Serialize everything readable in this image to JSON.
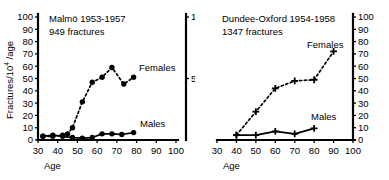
{
  "figure": {
    "background": "#ffffff",
    "ink_color": "#000000"
  },
  "chart_data": [
    {
      "type": "line",
      "panel": "left",
      "title": "Malmö 1953-1957",
      "subtitle": "949 fractures",
      "xlabel": "Age",
      "ylabel": "Fractures/10",
      "ylabel_exponent": "4",
      "ylabel_suffix": " /age",
      "xlim": [
        30,
        100
      ],
      "ylim": [
        0,
        100
      ],
      "xticks": [
        30,
        40,
        50,
        60,
        70,
        80,
        90,
        100
      ],
      "yticks": [
        0,
        10,
        20,
        30,
        40,
        50,
        60,
        70,
        80,
        90,
        100
      ],
      "xtick_labels": [
        "30",
        "40",
        "50",
        "60",
        "70",
        "80",
        "90",
        "100"
      ],
      "ytick_labels": [
        "0",
        "10",
        "20",
        "30",
        "40",
        "50",
        "60",
        "70",
        "80",
        "90",
        "100"
      ],
      "grid": false,
      "legend_position": "inline-right",
      "marker": "filled-circle",
      "series": [
        {
          "name": "Females",
          "label": "Females",
          "linestyle": "dashed",
          "x": [
            32.5,
            37.5,
            42.5,
            45,
            47.5,
            52.5,
            57.5,
            62.5,
            67.5,
            73.5,
            78.5
          ],
          "values": [
            3,
            3,
            4,
            5,
            10,
            31,
            47,
            51,
            59,
            45.5,
            51
          ]
        },
        {
          "name": "Males",
          "label": "Males",
          "linestyle": "solid",
          "x": [
            32.5,
            37.5,
            42.5,
            47.5,
            52.5,
            57.5,
            62.5,
            67.5,
            72.5,
            78.5
          ],
          "values": [
            3,
            4,
            3,
            2,
            1.5,
            2,
            5,
            5,
            4.5,
            6
          ]
        }
      ]
    },
    {
      "type": "line",
      "panel": "right",
      "title": "Dundee-Oxford 1954-1958",
      "subtitle": "1347 fractures",
      "xlabel": "Age",
      "ylabel": "",
      "xlim": [
        30,
        100
      ],
      "ylim": [
        0,
        100
      ],
      "xticks": [
        30,
        40,
        50,
        60,
        70,
        80,
        90,
        100
      ],
      "yticks": [
        0,
        10,
        20,
        30,
        40,
        50,
        60,
        70,
        80,
        90,
        100
      ],
      "xtick_labels": [
        "30",
        "40",
        "50",
        "60",
        "70",
        "80",
        "90",
        "100"
      ],
      "ytick_labels": [
        "0",
        "10",
        "20",
        "30",
        "40",
        "50",
        "60",
        "70",
        "80",
        "90",
        "100"
      ],
      "grid": false,
      "legend_position": "inline-right",
      "marker": "cross",
      "series": [
        {
          "name": "Females",
          "label": "Females",
          "linestyle": "dashed",
          "x": [
            40,
            50,
            60,
            70,
            80,
            90
          ],
          "values": [
            4,
            23,
            42,
            48,
            49,
            72
          ]
        },
        {
          "name": "Males",
          "label": "Males",
          "linestyle": "solid",
          "x": [
            40,
            50,
            60,
            70,
            80
          ],
          "values": [
            4,
            4,
            7,
            5,
            9.5
          ]
        }
      ]
    }
  ],
  "shared_axis": {
    "name": "middle-axis",
    "labels": [
      "100",
      "50"
    ],
    "values": [
      100,
      50
    ]
  }
}
